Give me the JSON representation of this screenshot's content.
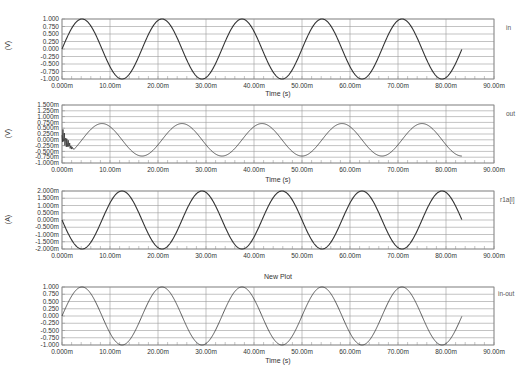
{
  "chart_data": [
    {
      "type": "line",
      "trace_name": "in",
      "ylabel": "(V)",
      "xlabel": "Time (s)",
      "xlim": [
        0,
        90
      ],
      "x_unit": "ms",
      "ylim": [
        -1.0,
        1.0
      ],
      "yticks": [
        "1.000",
        "0.750",
        "0.500",
        "0.250",
        "0.000",
        "-0.250",
        "-0.500",
        "-0.750",
        "-1.000"
      ],
      "xticks": [
        "0.000m",
        "10.00m",
        "20.00m",
        "30.00m",
        "40.00m",
        "50.00m",
        "60.00m",
        "70.00m",
        "80.00m",
        "90.00m"
      ],
      "grid": true,
      "series": [
        {
          "name": "in",
          "waveform": "sine",
          "amplitude": 1.0,
          "frequency_hz": 60,
          "phase_deg": 0,
          "t_end_ms": 83.3
        }
      ]
    },
    {
      "type": "line",
      "trace_name": "out",
      "ylabel": "(V)",
      "xlabel": "Time (s)",
      "xlim": [
        0,
        90
      ],
      "x_unit": "ms",
      "ylim": [
        -1.0,
        1.5
      ],
      "y_unit": "m",
      "yticks": [
        "1.500m",
        "1.250m",
        "1.000m",
        "0.750m",
        "0.500m",
        "0.250m",
        "0.000m",
        "-0.250m",
        "-0.500m",
        "-0.750m",
        "-1.000m"
      ],
      "xticks": [
        "0.000m",
        "10.00m",
        "20.00m",
        "30.00m",
        "40.00m",
        "50.00m",
        "60.00m",
        "70.00m",
        "80.00m",
        "90.00m"
      ],
      "grid": true,
      "series": [
        {
          "name": "out",
          "waveform": "sine with initial transient",
          "amplitude": 0.7,
          "frequency_hz": 60,
          "phase_deg": -90,
          "transient_ms": [
            0,
            2.5
          ],
          "t_end_ms": 83.3
        }
      ]
    },
    {
      "type": "line",
      "trace_name": "r1a[i]",
      "ylabel": "(A)",
      "xlabel": "",
      "xlim": [
        0,
        90
      ],
      "x_unit": "ms",
      "ylim": [
        -2.0,
        2.0
      ],
      "y_unit": "m",
      "yticks": [
        "2.000m",
        "1.500m",
        "1.000m",
        "0.500m",
        "0.000m",
        "-0.500m",
        "-1.000m",
        "-1.500m",
        "-2.000m"
      ],
      "xticks": [
        "0.000m",
        "10.00m",
        "20.00m",
        "30.00m",
        "40.00m",
        "50.00m",
        "60.00m",
        "70.00m",
        "80.00m",
        "90.00m"
      ],
      "grid": true,
      "series": [
        {
          "name": "r1a[i]",
          "waveform": "sine",
          "amplitude": 2.0,
          "frequency_hz": 60,
          "phase_deg": 180,
          "t_end_ms": 83.3
        }
      ]
    },
    {
      "type": "line",
      "title": "New Plot",
      "trace_name": "in-out",
      "ylabel": "",
      "xlabel": "Time (s)",
      "xlim": [
        0,
        90
      ],
      "x_unit": "ms",
      "ylim": [
        -1.0,
        1.0
      ],
      "yticks": [
        "1.000",
        "0.750",
        "0.500",
        "0.250",
        "0.000",
        "-0.250",
        "-0.500",
        "-0.750",
        "-1.000"
      ],
      "xticks": [
        "0.000m",
        "10.00m",
        "20.00m",
        "30.00m",
        "40.00m",
        "50.00m",
        "60.00m",
        "70.00m",
        "80.00m",
        "90.00m"
      ],
      "grid": true,
      "series": [
        {
          "name": "in-out",
          "waveform": "sine",
          "amplitude": 1.0,
          "frequency_hz": 60,
          "phase_deg": 0,
          "t_end_ms": 83.3
        }
      ]
    }
  ],
  "panels": [
    {
      "unit": "(V)",
      "trace": "in",
      "xtitle": "Time (s)",
      "title": ""
    },
    {
      "unit": "(V)",
      "trace": "out",
      "xtitle": "Time (s)",
      "title": ""
    },
    {
      "unit": "(A)",
      "trace": "r1a[i]",
      "xtitle": "",
      "title": "New Plot"
    },
    {
      "unit": "",
      "trace": "in-out",
      "xtitle": "Time (s)",
      "title": ""
    }
  ],
  "colors": {
    "trace": "#333333",
    "grid": "#9a9a9a",
    "frame": "#888888"
  }
}
